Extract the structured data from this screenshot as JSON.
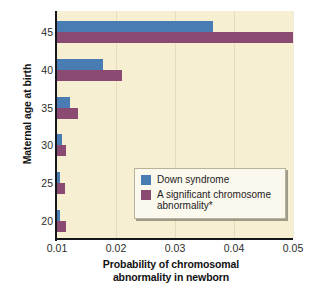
{
  "chart_data": {
    "type": "bar",
    "orientation": "horizontal",
    "title": "",
    "xlabel": "Probability of chromosomal abnormality in newborn",
    "ylabel": "Maternal age at birth",
    "categories": [
      "20",
      "25",
      "30",
      "35",
      "40",
      "45"
    ],
    "xlim": [
      0.01,
      0.05
    ],
    "xticks": [
      "0.01",
      "0.02",
      "0.03",
      "0.04",
      "0.05"
    ],
    "xtick_values": [
      0.01,
      0.02,
      0.03,
      0.04,
      0.05
    ],
    "yticks": [
      "20",
      "25",
      "30",
      "35",
      "40",
      "45"
    ],
    "grid": true,
    "legend_position": "lower-right",
    "series": [
      {
        "name": "Down syndrome",
        "color": "#4a7cb4",
        "values": [
          0.0105,
          0.0105,
          0.0109,
          0.0122,
          0.0178,
          0.0364
        ]
      },
      {
        "name": "A significant chromosome abnormality*",
        "color": "#8b4a71",
        "values": [
          0.0115,
          0.0114,
          0.0115,
          0.0136,
          0.0211,
          0.05
        ]
      }
    ]
  },
  "axes": {
    "y_title": "Maternal age at birth",
    "x_title_line1": "Probability of chromosomal",
    "x_title_line2": "abnormality in newborn"
  },
  "legend": {
    "items": [
      {
        "label": "Down syndrome",
        "color": "#4a7cb4"
      },
      {
        "label": "A significant chromosome abnormality*",
        "color": "#8b4a71"
      }
    ]
  },
  "colors": {
    "plot_background": "#f7efd2",
    "page_background": "#ffffff",
    "axis": "#15151c",
    "series_blue": "#4a7cb4",
    "series_purple": "#8b4a71",
    "legend_background": "#fbf8ee"
  }
}
